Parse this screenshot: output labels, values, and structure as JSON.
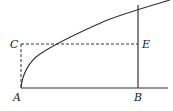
{
  "diagram": {
    "labels": {
      "A": "A",
      "B": "B",
      "C": "C",
      "E": "E"
    },
    "colors": {
      "line": "#333333",
      "background": "#ffffff"
    }
  }
}
